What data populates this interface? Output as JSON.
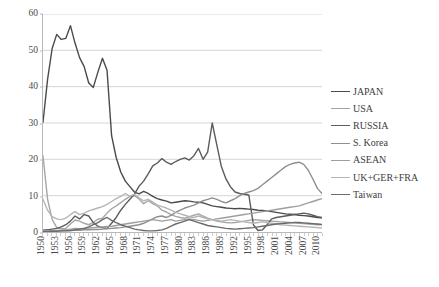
{
  "chart_data": {
    "type": "line",
    "title": "",
    "subtitle": "",
    "xlabel": "",
    "ylabel": "",
    "xlim": [
      1950,
      2011
    ],
    "ylim": [
      0,
      60
    ],
    "yticks": [
      0,
      10,
      20,
      30,
      40,
      50,
      60
    ],
    "grid": "horizontal",
    "legend_position": "right",
    "x": [
      1950,
      1951,
      1952,
      1953,
      1954,
      1955,
      1956,
      1957,
      1958,
      1959,
      1960,
      1961,
      1962,
      1963,
      1964,
      1965,
      1966,
      1967,
      1968,
      1969,
      1970,
      1971,
      1972,
      1973,
      1974,
      1975,
      1976,
      1977,
      1978,
      1979,
      1980,
      1981,
      1982,
      1983,
      1984,
      1985,
      1986,
      1987,
      1988,
      1989,
      1990,
      1991,
      1992,
      1993,
      1994,
      1995,
      1996,
      1997,
      1998,
      1999,
      2000,
      2001,
      2002,
      2003,
      2004,
      2005,
      2006,
      2007,
      2008,
      2009,
      2010,
      2011
    ],
    "xtick_labels": [
      "1950",
      "1953",
      "1956",
      "1959",
      "1962",
      "1965",
      "1968",
      "1971",
      "1974",
      "1977",
      "1980",
      "1983",
      "1986",
      "1989",
      "1992",
      "1995",
      "1998",
      "2001",
      "2004",
      "2007",
      "2010"
    ],
    "series": [
      {
        "name": "JAPAN",
        "color": "#4a4a4a",
        "values": [
          30.2,
          42.0,
          50.5,
          54.4,
          53.0,
          53.3,
          56.8,
          52.0,
          48.0,
          45.5,
          41.0,
          39.8,
          44.0,
          47.8,
          44.5,
          26.5,
          20.5,
          16.5,
          14.0,
          12.5,
          11.0,
          10.5,
          11.2,
          10.6,
          9.8,
          9.2,
          8.8,
          8.5,
          8.0,
          8.2,
          8.4,
          8.6,
          8.5,
          8.3,
          8.2,
          8.0,
          7.6,
          7.2,
          7.0,
          6.8,
          6.6,
          6.5,
          6.4,
          6.5,
          6.4,
          6.3,
          6.2,
          6.0,
          5.9,
          5.8,
          5.6,
          5.4,
          5.2,
          5.0,
          4.9,
          4.8,
          4.6,
          4.5,
          4.4,
          4.2,
          4.0,
          3.9
        ]
      },
      {
        "name": "USA",
        "color": "#a5a5a5",
        "values": [
          21.0,
          9.0,
          3.5,
          1.2,
          0.9,
          1.0,
          2.2,
          3.3,
          3.0,
          2.4,
          2.0,
          2.6,
          3.5,
          3.8,
          5.2,
          6.4,
          7.2,
          8.1,
          9.0,
          9.8,
          10.0,
          9.1,
          7.8,
          8.6,
          7.8,
          7.2,
          6.0,
          5.5,
          4.8,
          4.3,
          4.0,
          3.8,
          4.2,
          4.6,
          5.0,
          4.4,
          3.8,
          3.4,
          3.0,
          2.8,
          2.6,
          2.5,
          2.6,
          2.8,
          3.0,
          3.2,
          3.4,
          3.3,
          3.2,
          3.1,
          3.0,
          2.9,
          2.8,
          2.7,
          2.6,
          2.5,
          2.4,
          2.3,
          2.2,
          2.1,
          2.0,
          2.0
        ]
      },
      {
        "name": "RUSSIA",
        "color": "#5c5c5c",
        "values": [
          0.5,
          0.6,
          0.8,
          1.0,
          1.4,
          2.0,
          3.0,
          4.4,
          3.6,
          4.8,
          4.4,
          2.6,
          1.6,
          1.2,
          1.0,
          2.4,
          4.0,
          6.0,
          7.6,
          9.0,
          10.4,
          12.6,
          14.0,
          16.0,
          18.2,
          19.0,
          20.2,
          19.2,
          18.6,
          19.4,
          20.0,
          20.4,
          19.8,
          21.0,
          23.0,
          20.0,
          22.0,
          30.0,
          24.0,
          18.0,
          14.6,
          12.4,
          11.0,
          10.6,
          10.4,
          10.2,
          2.0,
          0.4,
          0.6,
          2.0,
          3.6,
          4.0,
          4.2,
          4.4,
          4.6,
          4.8,
          5.0,
          5.2,
          5.0,
          4.6,
          4.2,
          4.0
        ]
      },
      {
        "name": "S. Korea",
        "color": "#8f8f8f",
        "values": [
          0.2,
          0.2,
          0.2,
          0.3,
          0.3,
          0.4,
          0.4,
          0.5,
          0.5,
          0.6,
          0.6,
          0.7,
          0.7,
          0.8,
          0.9,
          1.0,
          1.1,
          1.2,
          1.4,
          1.6,
          1.8,
          2.0,
          2.4,
          3.0,
          3.6,
          4.2,
          4.4,
          4.0,
          4.6,
          5.4,
          6.0,
          6.6,
          7.0,
          7.4,
          8.0,
          8.6,
          9.0,
          9.4,
          9.0,
          8.4,
          8.0,
          8.6,
          9.2,
          10.0,
          10.6,
          11.0,
          11.4,
          12.0,
          13.0,
          14.0,
          15.0,
          16.0,
          17.0,
          18.0,
          18.6,
          19.0,
          19.2,
          18.6,
          17.0,
          14.6,
          12.0,
          10.6
        ]
      },
      {
        "name": "ASEAN",
        "color": "#9e9e9e",
        "values": [
          0.2,
          0.3,
          0.4,
          0.4,
          0.5,
          0.6,
          0.8,
          1.0,
          0.9,
          1.0,
          1.1,
          1.2,
          1.3,
          1.4,
          1.5,
          1.6,
          1.8,
          2.0,
          2.2,
          2.4,
          2.6,
          2.8,
          3.0,
          3.2,
          3.4,
          3.2,
          3.0,
          3.2,
          3.4,
          3.0,
          3.2,
          3.4,
          3.6,
          3.4,
          3.2,
          3.0,
          3.2,
          3.4,
          3.6,
          3.8,
          4.0,
          4.2,
          4.4,
          4.6,
          4.8,
          5.0,
          5.2,
          5.4,
          5.6,
          5.8,
          6.0,
          6.2,
          6.4,
          6.6,
          6.8,
          7.0,
          7.2,
          7.6,
          8.0,
          8.4,
          8.8,
          9.2
        ]
      },
      {
        "name": "UK+GER+FRA",
        "color": "#b5b5b5",
        "values": [
          9.0,
          6.0,
          4.2,
          3.6,
          3.4,
          3.8,
          4.8,
          5.6,
          4.8,
          5.2,
          5.8,
          6.2,
          6.6,
          7.0,
          7.6,
          8.4,
          9.2,
          9.8,
          10.6,
          9.8,
          10.4,
          9.4,
          8.6,
          9.0,
          8.2,
          7.4,
          7.0,
          6.6,
          6.0,
          5.4,
          5.0,
          4.6,
          4.2,
          4.0,
          4.4,
          4.0,
          3.6,
          3.4,
          3.2,
          3.0,
          3.2,
          3.4,
          3.2,
          3.0,
          2.8,
          2.6,
          2.4,
          2.6,
          2.8,
          2.6,
          2.4,
          2.2,
          2.0,
          1.9,
          1.8,
          1.7,
          1.6,
          1.5,
          1.4,
          1.3,
          1.2,
          1.1
        ]
      },
      {
        "name": "Taiwan",
        "color": "#6b6b6b",
        "values": [
          0.1,
          0.1,
          0.2,
          0.2,
          0.3,
          0.3,
          0.4,
          0.6,
          0.8,
          1.0,
          1.4,
          2.0,
          2.6,
          3.4,
          4.0,
          3.2,
          2.6,
          2.0,
          1.6,
          1.2,
          0.8,
          0.6,
          0.4,
          0.3,
          0.3,
          0.4,
          0.6,
          1.0,
          1.6,
          2.2,
          2.6,
          3.0,
          3.4,
          3.0,
          2.6,
          2.2,
          1.8,
          1.6,
          1.4,
          1.2,
          1.0,
          0.9,
          0.8,
          0.9,
          1.0,
          1.1,
          1.2,
          1.4,
          1.6,
          1.8,
          2.0,
          2.2,
          2.3,
          2.4,
          2.5,
          2.6,
          2.6,
          2.5,
          2.4,
          2.3,
          2.2,
          2.1
        ]
      }
    ]
  },
  "legend": {
    "entries": [
      {
        "label": "JAPAN"
      },
      {
        "label": "USA"
      },
      {
        "label": "RUSSIA"
      },
      {
        "label": "S. Korea"
      },
      {
        "label": "ASEAN"
      },
      {
        "label": "UK+GER+FRA"
      },
      {
        "label": "Taiwan"
      }
    ]
  }
}
